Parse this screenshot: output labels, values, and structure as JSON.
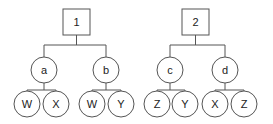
{
  "diagram": {
    "stroke": "#555555",
    "trees": [
      {
        "root": {
          "label": "1",
          "x": 63,
          "y": 9,
          "w": 27,
          "h": 26
        },
        "bus_y": 45,
        "children": [
          {
            "label": "a",
            "cx": 44,
            "cy": 70,
            "bus_y": 90,
            "leaves": [
              {
                "label": "W",
                "cx": 27,
                "cy": 104
              },
              {
                "label": "X",
                "cx": 56,
                "cy": 104
              }
            ]
          },
          {
            "label": "b",
            "cx": 106,
            "cy": 70,
            "bus_y": 90,
            "leaves": [
              {
                "label": "W",
                "cx": 92,
                "cy": 104
              },
              {
                "label": "Y",
                "cx": 121,
                "cy": 104
              }
            ]
          }
        ]
      },
      {
        "root": {
          "label": "2",
          "x": 182,
          "y": 9,
          "w": 27,
          "h": 26
        },
        "bus_y": 45,
        "children": [
          {
            "label": "c",
            "cx": 170,
            "cy": 70,
            "bus_y": 90,
            "leaves": [
              {
                "label": "Z",
                "cx": 157,
                "cy": 104
              },
              {
                "label": "Y",
                "cx": 185,
                "cy": 104
              }
            ]
          },
          {
            "label": "d",
            "cx": 225,
            "cy": 70,
            "bus_y": 90,
            "leaves": [
              {
                "label": "X",
                "cx": 215,
                "cy": 104
              },
              {
                "label": "Z",
                "cx": 244,
                "cy": 104
              }
            ]
          }
        ]
      }
    ]
  }
}
